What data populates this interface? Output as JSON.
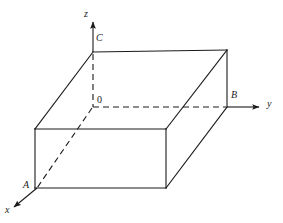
{
  "figure": {
    "background_color": "#ffffff",
    "stroke_color": "#1b1b1b",
    "label_color": "#1b1b1b",
    "solid_stroke_width": 1.1,
    "dashed_stroke_width": 1.1,
    "dash_pattern": "6,4",
    "labels": {
      "axis_z": "z",
      "axis_y": "y",
      "axis_x": "x",
      "vertex_C": "C",
      "vertex_B": "B",
      "vertex_A": "A",
      "origin": "0"
    },
    "axes": [
      {
        "name": "z-axis",
        "label": "z",
        "direction": "up",
        "from": [
          93,
          52
        ],
        "to": [
          93,
          20
        ],
        "style": "solid-arrow"
      },
      {
        "name": "y-axis",
        "label": "y",
        "direction": "right",
        "from": [
          227,
          107
        ],
        "to": [
          262,
          107
        ],
        "style": "solid-arrow"
      },
      {
        "name": "x-axis",
        "label": "x",
        "direction": "down-left",
        "from": [
          37,
          188
        ],
        "to": [
          11,
          209
        ],
        "style": "solid-arrow"
      }
    ],
    "vertices": [
      {
        "name": "C",
        "label": "C",
        "point": [
          93,
          52
        ],
        "description": "top-back-left corner of box, on z-axis"
      },
      {
        "name": "O",
        "label": "0",
        "point": [
          93,
          107
        ],
        "description": "origin of coordinate system, hidden inside box"
      },
      {
        "name": "B",
        "label": "B",
        "point": [
          227,
          107
        ],
        "description": "on y-axis at right rear of box"
      },
      {
        "name": "A",
        "label": "A",
        "point": [
          37,
          188
        ],
        "description": "on x-axis at front-left bottom of box"
      }
    ],
    "solid_edges": [
      {
        "name": "top-back-edge",
        "from": [
          93,
          52
        ],
        "to": [
          227,
          50
        ]
      },
      {
        "name": "top-left-edge",
        "from": [
          93,
          52
        ],
        "to": [
          35,
          129
        ]
      },
      {
        "name": "top-front-edge",
        "from": [
          35,
          129
        ],
        "to": [
          166,
          129
        ]
      },
      {
        "name": "top-right-edge",
        "from": [
          166,
          129
        ],
        "to": [
          227,
          50
        ]
      },
      {
        "name": "front-left-vertical",
        "from": [
          35,
          129
        ],
        "to": [
          35,
          188
        ]
      },
      {
        "name": "front-right-vertical",
        "from": [
          166,
          129
        ],
        "to": [
          166,
          188
        ]
      },
      {
        "name": "front-bottom-edge",
        "from": [
          35,
          188
        ],
        "to": [
          166,
          188
        ]
      },
      {
        "name": "back-right-vertical",
        "from": [
          227,
          50
        ],
        "to": [
          227,
          107
        ]
      },
      {
        "name": "bottom-right-edge",
        "from": [
          166,
          188
        ],
        "to": [
          227,
          107
        ]
      }
    ],
    "dashed_edges": [
      {
        "name": "hidden-z-segment",
        "from": [
          93,
          52
        ],
        "to": [
          93,
          107
        ]
      },
      {
        "name": "hidden-y-segment",
        "from": [
          93,
          107
        ],
        "to": [
          227,
          107
        ]
      },
      {
        "name": "hidden-x-segment",
        "from": [
          93,
          107
        ],
        "to": [
          37,
          188
        ]
      }
    ]
  }
}
